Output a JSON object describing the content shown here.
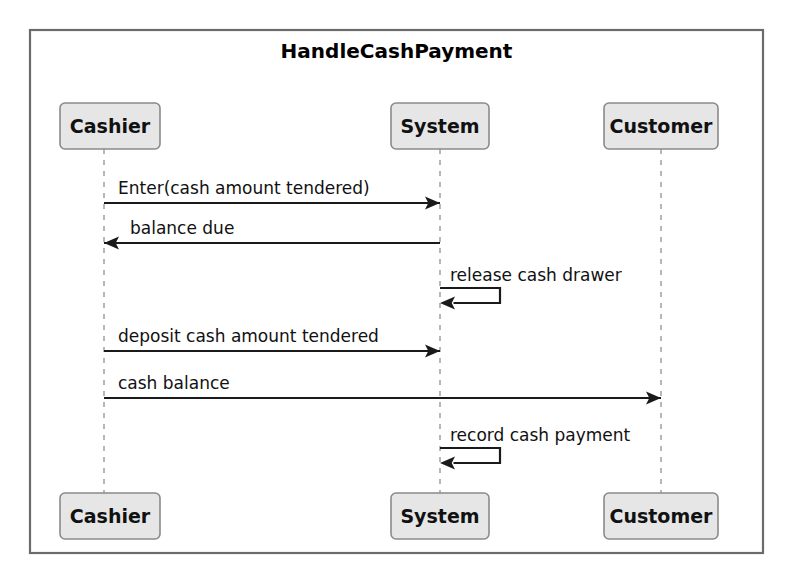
{
  "diagram": {
    "type": "uml-sequence-diagram",
    "title": "HandleCashPayment",
    "frame": {
      "x": 30,
      "y": 30,
      "width": 733,
      "height": 523,
      "border_color": "#6b6b6b",
      "fill": "#ffffff"
    },
    "participants": [
      {
        "id": "cashier",
        "name": "Cashier",
        "lifeline_x": 104,
        "box_top": {
          "x": 60,
          "y": 103,
          "width": 100,
          "height": 46
        },
        "box_bottom": {
          "x": 60,
          "y": 493,
          "width": 100,
          "height": 46
        }
      },
      {
        "id": "system",
        "name": "System",
        "lifeline_x": 440,
        "box_top": {
          "x": 391,
          "y": 103,
          "width": 98,
          "height": 46
        },
        "box_bottom": {
          "x": 391,
          "y": 493,
          "width": 98,
          "height": 46
        }
      },
      {
        "id": "customer",
        "name": "Customer",
        "lifeline_x": 661,
        "box_top": {
          "x": 604,
          "y": 103,
          "width": 114,
          "height": 46
        },
        "box_bottom": {
          "x": 604,
          "y": 493,
          "width": 114,
          "height": 46
        }
      }
    ],
    "messages": [
      {
        "index": 1,
        "label": "Enter(cash amount tendered)",
        "from": "cashier",
        "to": "system",
        "kind": "call",
        "direction": "right",
        "y": 203,
        "label_x": 118,
        "label_y": 194
      },
      {
        "index": 2,
        "label": "balance due",
        "from": "system",
        "to": "cashier",
        "kind": "reply",
        "direction": "left",
        "y": 243,
        "label_x": 130,
        "label_y": 234
      },
      {
        "index": 3,
        "label": "release cash drawer",
        "from": "system",
        "to": "system",
        "kind": "self",
        "direction": "self",
        "y": 288,
        "loop_bottom_y": 303,
        "loop_width": 60,
        "label_x": 450,
        "label_y": 281
      },
      {
        "index": 4,
        "label": "deposit cash amount tendered",
        "from": "cashier",
        "to": "system",
        "kind": "call",
        "direction": "right",
        "y": 351,
        "label_x": 118,
        "label_y": 342
      },
      {
        "index": 5,
        "label": "cash balance",
        "from": "cashier",
        "to": "customer",
        "kind": "call",
        "direction": "right",
        "y": 398,
        "label_x": 118,
        "label_y": 389
      },
      {
        "index": 6,
        "label": "record cash payment",
        "from": "system",
        "to": "system",
        "kind": "self",
        "direction": "self",
        "y": 448,
        "loop_bottom_y": 463,
        "loop_width": 60,
        "label_x": 450,
        "label_y": 441
      }
    ],
    "colors": {
      "frame_border": "#6b6b6b",
      "participant_fill": "#e6e6e6",
      "participant_border": "#8a8a8a",
      "lifeline": "#b0b0b0",
      "message_line": "#1a1a1a",
      "text": "#111111",
      "background": "#ffffff"
    }
  }
}
